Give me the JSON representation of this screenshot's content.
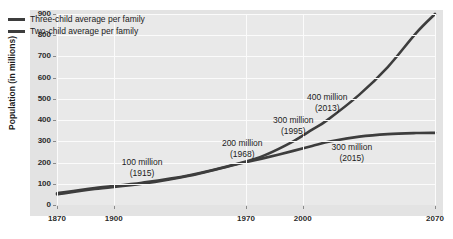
{
  "caption_clipped": "· · · ·",
  "chart_data": {
    "type": "line",
    "title": "",
    "xlabel": "",
    "ylabel": "Population (in millions)",
    "xlim": [
      1870,
      2070
    ],
    "ylim": [
      0,
      900
    ],
    "grid": true,
    "legend_position": "top-left",
    "xticks": [
      1870,
      1900,
      1970,
      2000,
      2070
    ],
    "xtick_labels": [
      "1870",
      "1900",
      "1970",
      "2000",
      "2070"
    ],
    "yticks": [
      0,
      100,
      200,
      300,
      400,
      500,
      600,
      700,
      800,
      900
    ],
    "ytick_labels": [
      "0",
      "100",
      "200",
      "300",
      "400",
      "500",
      "600",
      "700",
      "800",
      "900"
    ],
    "series": [
      {
        "name": "Three-child average per family",
        "color": "#3d3d3d",
        "x": [
          1870,
          1890,
          1915,
          1940,
          1968,
          1980,
          1995,
          2005,
          2013,
          2030,
          2045,
          2060,
          2070
        ],
        "values": [
          55,
          80,
          105,
          140,
          200,
          235,
          300,
          355,
          400,
          520,
          650,
          810,
          900
        ]
      },
      {
        "name": "Two-child average per family",
        "color": "#3d3d3d",
        "x": [
          1870,
          1890,
          1915,
          1940,
          1968,
          1980,
          1995,
          2005,
          2015,
          2030,
          2045,
          2060,
          2070
        ],
        "values": [
          50,
          75,
          100,
          138,
          198,
          222,
          255,
          278,
          300,
          322,
          334,
          339,
          340
        ]
      }
    ],
    "annotations": [
      {
        "text_line1": "100 million",
        "text_line2": "(1915)",
        "x": 1915,
        "y": 175
      },
      {
        "text_line1": "200 million",
        "text_line2": "(1968)",
        "x": 1968,
        "y": 265
      },
      {
        "text_line1": "300 million",
        "text_line2": "(1995)",
        "x": 1995,
        "y": 370
      },
      {
        "text_line1": "400 million",
        "text_line2": "(2013)",
        "x": 2013,
        "y": 480
      },
      {
        "text_line1": "300 million",
        "text_line2": "(2015)",
        "x": 2026,
        "y": 245
      }
    ]
  },
  "legend": {
    "items": [
      {
        "label": "Three-child average per family"
      },
      {
        "label": "Two-child average per family"
      }
    ]
  },
  "colors": {
    "line": "#3d3d3d",
    "panel": "#e3e3e3",
    "plot_background": "#e9e9e9",
    "gridline": "#fbfbfb",
    "text": "#1c1c1c"
  }
}
